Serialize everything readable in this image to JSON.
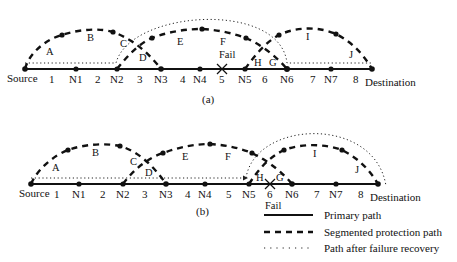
{
  "diagram_a": {
    "caption": "(a)",
    "nodes": [
      "Source",
      "N1",
      "N2",
      "N3",
      "N4",
      "N5",
      "N6",
      "N7",
      "Destination"
    ],
    "links": [
      "1",
      "2",
      "3",
      "4",
      "5",
      "6",
      "7",
      "8"
    ],
    "segment_labels": [
      "A",
      "B",
      "C",
      "D",
      "E",
      "F",
      "G",
      "H",
      "I",
      "J"
    ],
    "fail_label": "Fail"
  },
  "diagram_b": {
    "caption": "(b)",
    "nodes": [
      "Source",
      "N1",
      "N2",
      "N3",
      "N4",
      "N5",
      "N6",
      "N7",
      "Destination"
    ],
    "links": [
      "1",
      "2",
      "3",
      "4",
      "5",
      "6",
      "7",
      "8"
    ],
    "segment_labels": [
      "A",
      "B",
      "C",
      "D",
      "E",
      "F",
      "G",
      "H",
      "I",
      "J"
    ],
    "fail_label": "Fail"
  },
  "legend": {
    "items": [
      {
        "style": "solid",
        "label": "Primary path"
      },
      {
        "style": "dashed",
        "label": "Segmented protection path"
      },
      {
        "style": "dotted",
        "label": "Path after failure recovery"
      }
    ]
  }
}
